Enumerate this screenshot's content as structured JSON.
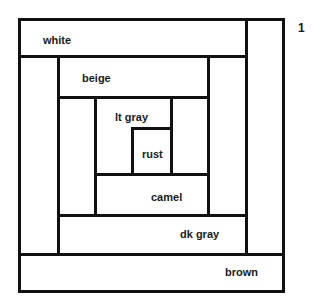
{
  "diagram": {
    "block_number": "1",
    "pieces": [
      {
        "name": "white",
        "label": "white"
      },
      {
        "name": "beige",
        "label": "beige"
      },
      {
        "name": "lt-gray",
        "label": "lt gray"
      },
      {
        "name": "rust",
        "label": "rust"
      },
      {
        "name": "camel",
        "label": "camel"
      },
      {
        "name": "dk-gray",
        "label": "dk gray"
      },
      {
        "name": "brown",
        "label": "brown"
      }
    ],
    "line_color": "#111111",
    "background_color": "#ffffff"
  }
}
